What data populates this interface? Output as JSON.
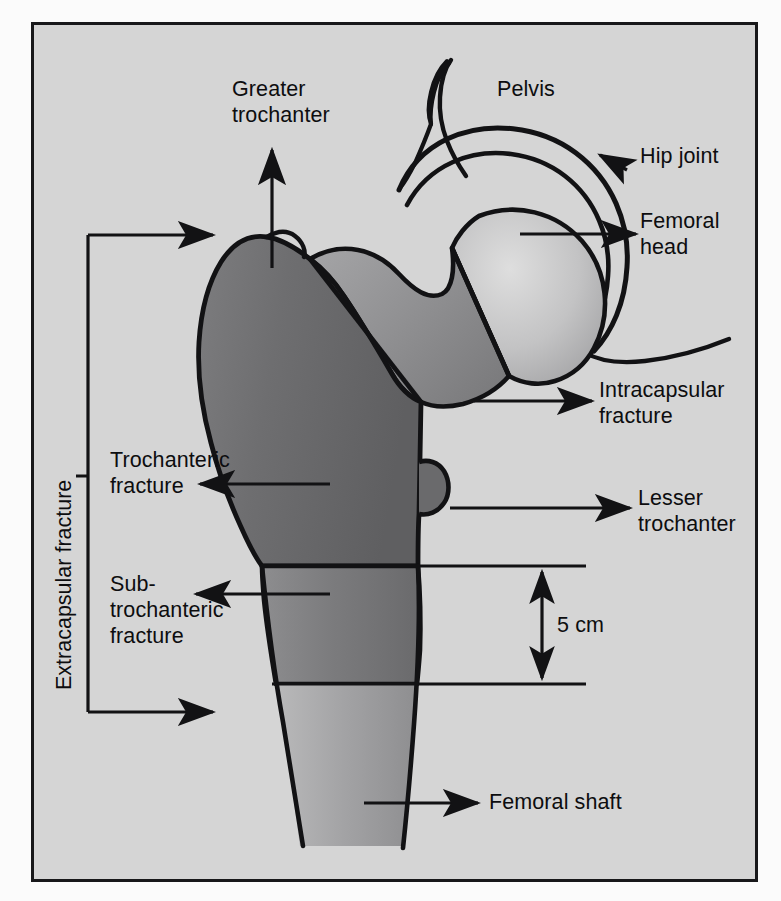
{
  "figure": {
    "type": "anatomical-diagram",
    "frame": {
      "background_color": "#d5d5d5",
      "border_color": "#18181a"
    },
    "bone_colors": {
      "outline": "#121214",
      "trochanteric_mass_dark": "#6f6f70",
      "neck_mid": "#8e8e90",
      "head_light": "#c9c9c9",
      "shaft_mid": "#9a9a9c"
    }
  },
  "labels": {
    "greater_trochanter": "Greater\ntrochanter",
    "pelvis": "Pelvis",
    "hip_joint": "Hip joint",
    "femoral_head": "Femoral\nhead",
    "intracapsular_fracture": "Intracapsular\nfracture",
    "lesser_trochanter": "Lesser\ntrochanter",
    "trochanteric_fracture": "Trochanteric\nfracture",
    "subtrochanteric_fracture": "Sub-\ntrochanteric\nfracture",
    "extracapsular_fracture": "Extracapsular fracture",
    "femoral_shaft": "Femoral shaft",
    "measurement_5cm": "5 cm"
  },
  "annotations": [
    {
      "name": "greater-trochanter",
      "text": "Greater trochanter",
      "arrow": "up",
      "target": "greater trochanter apex"
    },
    {
      "name": "pelvis",
      "text": "Pelvis",
      "arrow": "none",
      "target": "iliac outline"
    },
    {
      "name": "hip-joint",
      "text": "Hip joint",
      "arrow": "left-up",
      "target": "acetabular joint space"
    },
    {
      "name": "femoral-head",
      "text": "Femoral head",
      "arrow": "right",
      "target": "femoral head"
    },
    {
      "name": "intracapsular-fracture",
      "text": "Intracapsular fracture",
      "arrow": "right",
      "target": "femoral neck"
    },
    {
      "name": "lesser-trochanter",
      "text": "Lesser trochanter",
      "arrow": "right",
      "target": "lesser trochanter"
    },
    {
      "name": "trochanteric-fracture",
      "text": "Trochanteric fracture",
      "arrow": "left",
      "target": "intertrochanteric line"
    },
    {
      "name": "subtrochanteric-fracture",
      "text": "Sub-trochanteric fracture",
      "arrow": "left",
      "target": "subtrochanteric zone"
    },
    {
      "name": "extracapsular-fracture",
      "text": "Extracapsular fracture",
      "arrow": "bracket-right",
      "target": "trochanteric and subtrochanteric region"
    },
    {
      "name": "femoral-shaft",
      "text": "Femoral shaft",
      "arrow": "right",
      "target": "femoral diaphysis"
    },
    {
      "name": "measurement-5cm",
      "text": "5 cm",
      "arrow": "double-vertical",
      "target": "subtrochanteric segment height"
    }
  ]
}
